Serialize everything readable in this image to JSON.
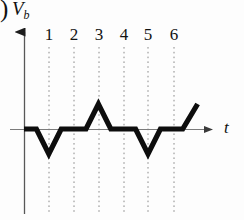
{
  "figure": {
    "panel_marker": ")",
    "y_axis_label": "V",
    "y_axis_label_sub": "b",
    "x_axis_label": "t",
    "tick_labels": [
      "1",
      "2",
      "3",
      "4",
      "5",
      "6"
    ]
  },
  "colors": {
    "waveform": "#0d0d0d",
    "axis": "#6f6f6f",
    "gridline": "#8a8a8a",
    "background": "#fdfdfd",
    "text": "#111111"
  },
  "chart_data": {
    "type": "line",
    "title": "",
    "xlabel": "t",
    "ylabel": "V_b",
    "grid": true,
    "legend": null,
    "xlim": [
      0,
      7.5
    ],
    "ylim": [
      -1.4,
      1.4
    ],
    "xticks": [
      1,
      2,
      3,
      4,
      5,
      6
    ],
    "xticklabels": [
      "1",
      "2",
      "3",
      "4",
      "5",
      "6"
    ],
    "yticks": [],
    "series": [
      {
        "name": "V_b",
        "x": [
          0.0,
          0.5,
          1.0,
          1.5,
          2.5,
          3.0,
          3.5,
          4.5,
          5.0,
          5.5,
          6.4,
          7.0
        ],
        "y": [
          0,
          0,
          -1,
          0,
          0,
          1,
          0,
          0,
          -1,
          0,
          0,
          1
        ]
      }
    ]
  }
}
